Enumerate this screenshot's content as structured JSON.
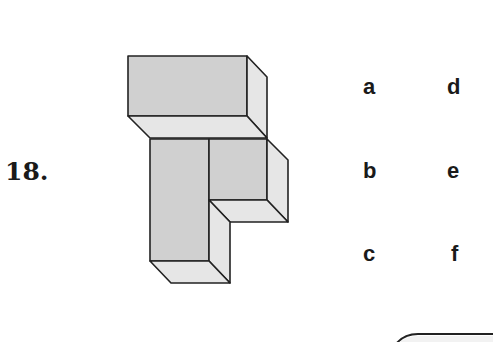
{
  "question": {
    "number_label": "18."
  },
  "figure": {
    "front_face_color": "#d0d0d0",
    "side_face_color": "#e6e6e6",
    "edge_color": "#222222"
  },
  "options": [
    {
      "label": "a"
    },
    {
      "label": "b"
    },
    {
      "label": "c"
    },
    {
      "label": "d"
    },
    {
      "label": "e"
    },
    {
      "label": "f"
    }
  ]
}
